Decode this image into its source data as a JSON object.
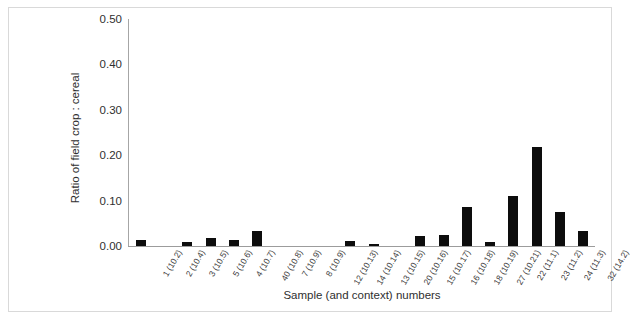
{
  "chart_data": {
    "type": "bar",
    "title": "",
    "xlabel": "Sample (and context) numbers",
    "ylabel": "Ratio of field crop : cereal",
    "ylim": [
      0,
      0.5
    ],
    "ytick_labels": [
      "0.50",
      "0.40",
      "0.30",
      "0.20",
      "0.10",
      "0.00"
    ],
    "ytick_values": [
      0.5,
      0.4,
      0.3,
      0.2,
      0.1,
      0.0
    ],
    "grid": false,
    "legend": null,
    "bar_color": "#0d0d0d",
    "categories": [
      "1 (10.2)",
      "2 (10.4)",
      "3 (10.5)",
      "5 (10.6)",
      "4 (10.7)",
      "40 (10.8)",
      "7 (10.9)",
      "8 (10.9)",
      "12 (10.13)",
      "14 (10.14)",
      "13 (10.15)",
      "20 (10.16)",
      "15 (10.17)",
      "16 (10.18)",
      "18 (10.19)",
      "27 (10.21)",
      "22 (11.1)",
      "23 (11.2)",
      "24 (11.3)",
      "32 (14.2)"
    ],
    "values": [
      0.013,
      0.0,
      0.008,
      0.017,
      0.013,
      0.033,
      0.0,
      0.0,
      0.0,
      0.011,
      0.004,
      0.0,
      0.022,
      0.024,
      0.085,
      0.009,
      0.111,
      0.219,
      0.074,
      0.033
    ]
  }
}
